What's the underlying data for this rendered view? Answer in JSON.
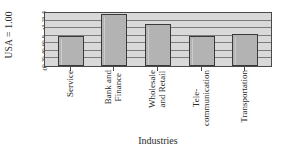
{
  "chart_data": {
    "type": "bar",
    "title": "",
    "xlabel": "Industries",
    "ylabel": "USA = 1.00",
    "categories": [
      "Service",
      "Bank and Finance",
      "Wholesale and Retail",
      "Tele-communication",
      "Transportation"
    ],
    "values": [
      0.78,
      1.38,
      1.1,
      0.78,
      0.85
    ],
    "ylim": [
      0,
      1.4
    ],
    "yticks": [
      "0",
      "0.2",
      "0.4",
      "0.6",
      "0.8",
      "1",
      "1.2",
      "1.4"
    ],
    "ytick_values": [
      0,
      0.2,
      0.4,
      0.6,
      0.8,
      1.0,
      1.2,
      1.4
    ],
    "grid": true,
    "legend": false,
    "legend_position": "none",
    "colors": {
      "bar_fill": "#b3b3b3",
      "bar_border": "#3a3a3a",
      "plot_background": "#d9d9d9",
      "gridline": "#7d7d7d",
      "axis": "#4a4a4a",
      "text": "#2b2b2b"
    }
  },
  "axis": {
    "y_title": "USA = 1.00",
    "x_title": "Industries"
  },
  "categories_lines": [
    {
      "line1": "Service",
      "line2": ""
    },
    {
      "line1": "Bank and",
      "line2": "Finance"
    },
    {
      "line1": "Wholesale",
      "line2": "and Retail"
    },
    {
      "line1": "Tele-",
      "line2": "communication"
    },
    {
      "line1": "Transportation",
      "line2": ""
    }
  ]
}
